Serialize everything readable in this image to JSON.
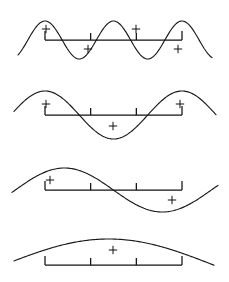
{
  "figure": {
    "background_color": "#ffffff",
    "stroke_color": "#1a1a1a",
    "width": 229,
    "height": 282,
    "panel_count": 4
  },
  "chart_data": {
    "type": "line",
    "xlabel": "",
    "ylabel": "",
    "grid": false,
    "legend": null,
    "x_domain": [
      0,
      229
    ],
    "shared_axis_bar": {
      "x_start": 45,
      "x_end": 182,
      "length_px": 137,
      "tick_fractions": [
        0.0,
        0.3333,
        0.6667,
        1.0
      ],
      "end_tick_height_px": 9,
      "interior_tick_height_px": 7
    },
    "panels": [
      {
        "index": 1,
        "name": "panel-four-half-wavelengths",
        "cycles_across_bar": 2,
        "wavelength_px": 68.5,
        "amplitude_px": 19,
        "phase": "cosine",
        "baseline_y": 40,
        "curve_x_start": 18,
        "curve_x_end": 212,
        "axis_bar_y": 40,
        "markers": [
          {
            "label": "+",
            "x": 46,
            "y": 29
          },
          {
            "label": "+",
            "x": 88,
            "y": 49
          },
          {
            "label": "+",
            "x": 136,
            "y": 29
          },
          {
            "label": "+",
            "x": 178,
            "y": 49
          }
        ]
      },
      {
        "index": 2,
        "name": "panel-two-half-wavelengths",
        "cycles_across_bar": 1,
        "wavelength_px": 137,
        "amplitude_px": 24,
        "phase": "cosine",
        "baseline_y": 115,
        "curve_x_start": 14,
        "curve_x_end": 216,
        "axis_bar_y": 115,
        "markers": [
          {
            "label": "+",
            "x": 46,
            "y": 104
          },
          {
            "label": "+",
            "x": 113,
            "y": 126
          },
          {
            "label": "+",
            "x": 180,
            "y": 104
          }
        ]
      },
      {
        "index": 3,
        "name": "panel-one-wavelength-sine",
        "cycles_across_bar": 1,
        "wavelength_px": 196,
        "amplitude_px": 22,
        "phase": "sine-offset",
        "baseline_y": 190,
        "curve_x_start": 12,
        "curve_x_end": 218,
        "axis_bar_y": 190,
        "markers": [
          {
            "label": "+",
            "x": 50,
            "y": 180
          },
          {
            "label": "+",
            "x": 172,
            "y": 200
          }
        ]
      },
      {
        "index": 4,
        "name": "panel-single-arc",
        "cycles_across_bar": 0.5,
        "wavelength_px": 420,
        "amplitude_px": 26,
        "phase": "half-arc",
        "baseline_y": 265,
        "curve_x_start": 14,
        "curve_x_end": 214,
        "axis_bar_y": 265,
        "markers": [
          {
            "label": "+",
            "x": 113,
            "y": 250
          }
        ]
      }
    ]
  }
}
